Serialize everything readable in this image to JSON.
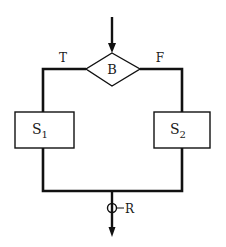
{
  "diagram": {
    "type": "flowchart-if-then-else",
    "decision": {
      "label": "B"
    },
    "branches": {
      "true_label": "T",
      "false_label": "F"
    },
    "statements": [
      {
        "name": "S",
        "subscript": "1"
      },
      {
        "name": "S",
        "subscript": "2"
      }
    ],
    "merge_point": {
      "label": "R"
    },
    "colors": {
      "stroke": "#111111",
      "background": "#ffffff"
    }
  }
}
